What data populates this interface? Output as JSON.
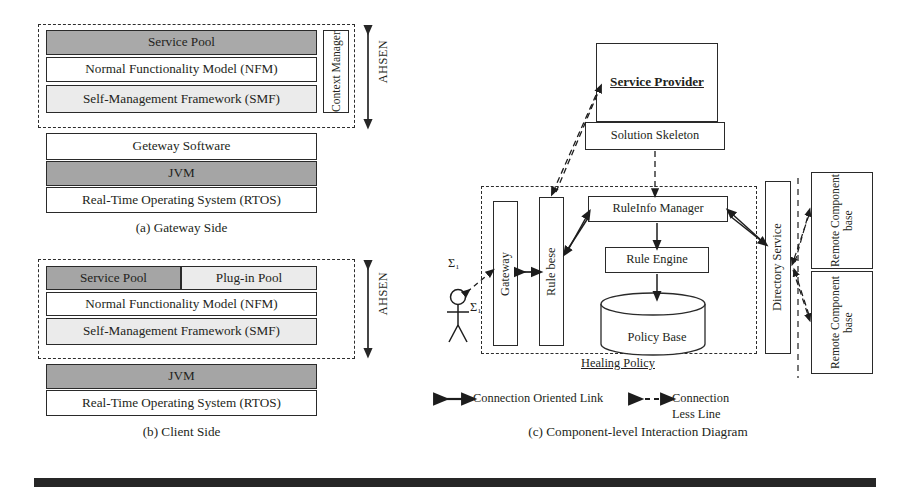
{
  "panel_a": {
    "caption": "(a) Gateway Side",
    "ahsen_label": "AHSEN",
    "layers": [
      {
        "label": "Service Pool",
        "shade": "dark"
      },
      {
        "label": "Normal Functionality Model (NFM)",
        "shade": "white"
      },
      {
        "label": "Self-Management Framework (SMF)",
        "shade": "lite"
      }
    ],
    "side_box": "Context Manager",
    "lower_layers": [
      {
        "label": "Geteway Software",
        "shade": "white"
      },
      {
        "label": "JVM",
        "shade": "mid"
      },
      {
        "label": "Real-Time Operating System (RTOS)",
        "shade": "white"
      }
    ]
  },
  "panel_b": {
    "caption": "(b) Client Side",
    "ahsen_label": "AHSEN",
    "top_row": [
      {
        "label": "Service Pool",
        "shade": "mid"
      },
      {
        "label": "Plug-in Pool",
        "shade": "lite"
      }
    ],
    "layers": [
      {
        "label": "Normal Functionality Model (NFM)",
        "shade": "white"
      },
      {
        "label": "Self-Management Framework (SMF)",
        "shade": "lite"
      }
    ],
    "lower_layers": [
      {
        "label": "JVM",
        "shade": "mid"
      },
      {
        "label": "Real-Time Operating System (RTOS)",
        "shade": "white"
      }
    ]
  },
  "panel_c": {
    "caption": "(c) Component-level Interaction Diagram",
    "service_provider": "Service Provider",
    "solution_skeleton": "Solution Skeleton",
    "gateway": "Gateway",
    "rule_base": "Rule bese",
    "ruleinfo_manager": "RuleInfo Manager",
    "rule_engine": "Rule Engine",
    "policy_base": "Policy Base",
    "directory_service": "Directory Service",
    "remote_components": [
      "Remote Component base",
      "Remote Component base"
    ],
    "healing_policy": "Healing Policy",
    "actor_labels": [
      "Σ₁",
      "Σ₁"
    ],
    "legend": [
      {
        "label": "Connection Oriented Link",
        "style": "solid-double-arrow"
      },
      {
        "label": "Connection Less Line",
        "style": "dashed-double-arrow"
      }
    ]
  },
  "colors": {
    "ink": "#231f20",
    "dark_shade": "#a9a9a9",
    "mid_shade": "#a5a5a5",
    "light_shade": "#ebebeb",
    "bottom_bar": "#262626"
  }
}
